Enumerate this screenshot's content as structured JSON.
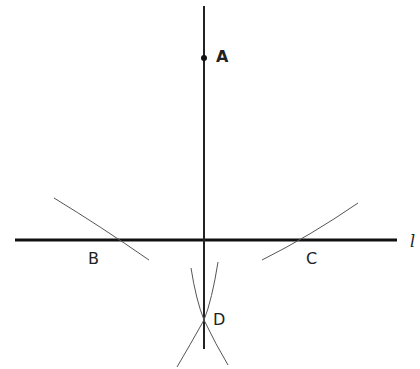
{
  "diagram": {
    "line_label": "l",
    "points": {
      "A": {
        "label": "A",
        "x": 204,
        "y": 58
      },
      "B": {
        "label": "B",
        "x": 104,
        "y": 240
      },
      "C": {
        "label": "C",
        "x": 305,
        "y": 240
      },
      "D": {
        "label": "D",
        "x": 204,
        "y": 320
      }
    },
    "colors": {
      "line": "#111111",
      "arc": "#555555",
      "text": "#222222"
    }
  }
}
